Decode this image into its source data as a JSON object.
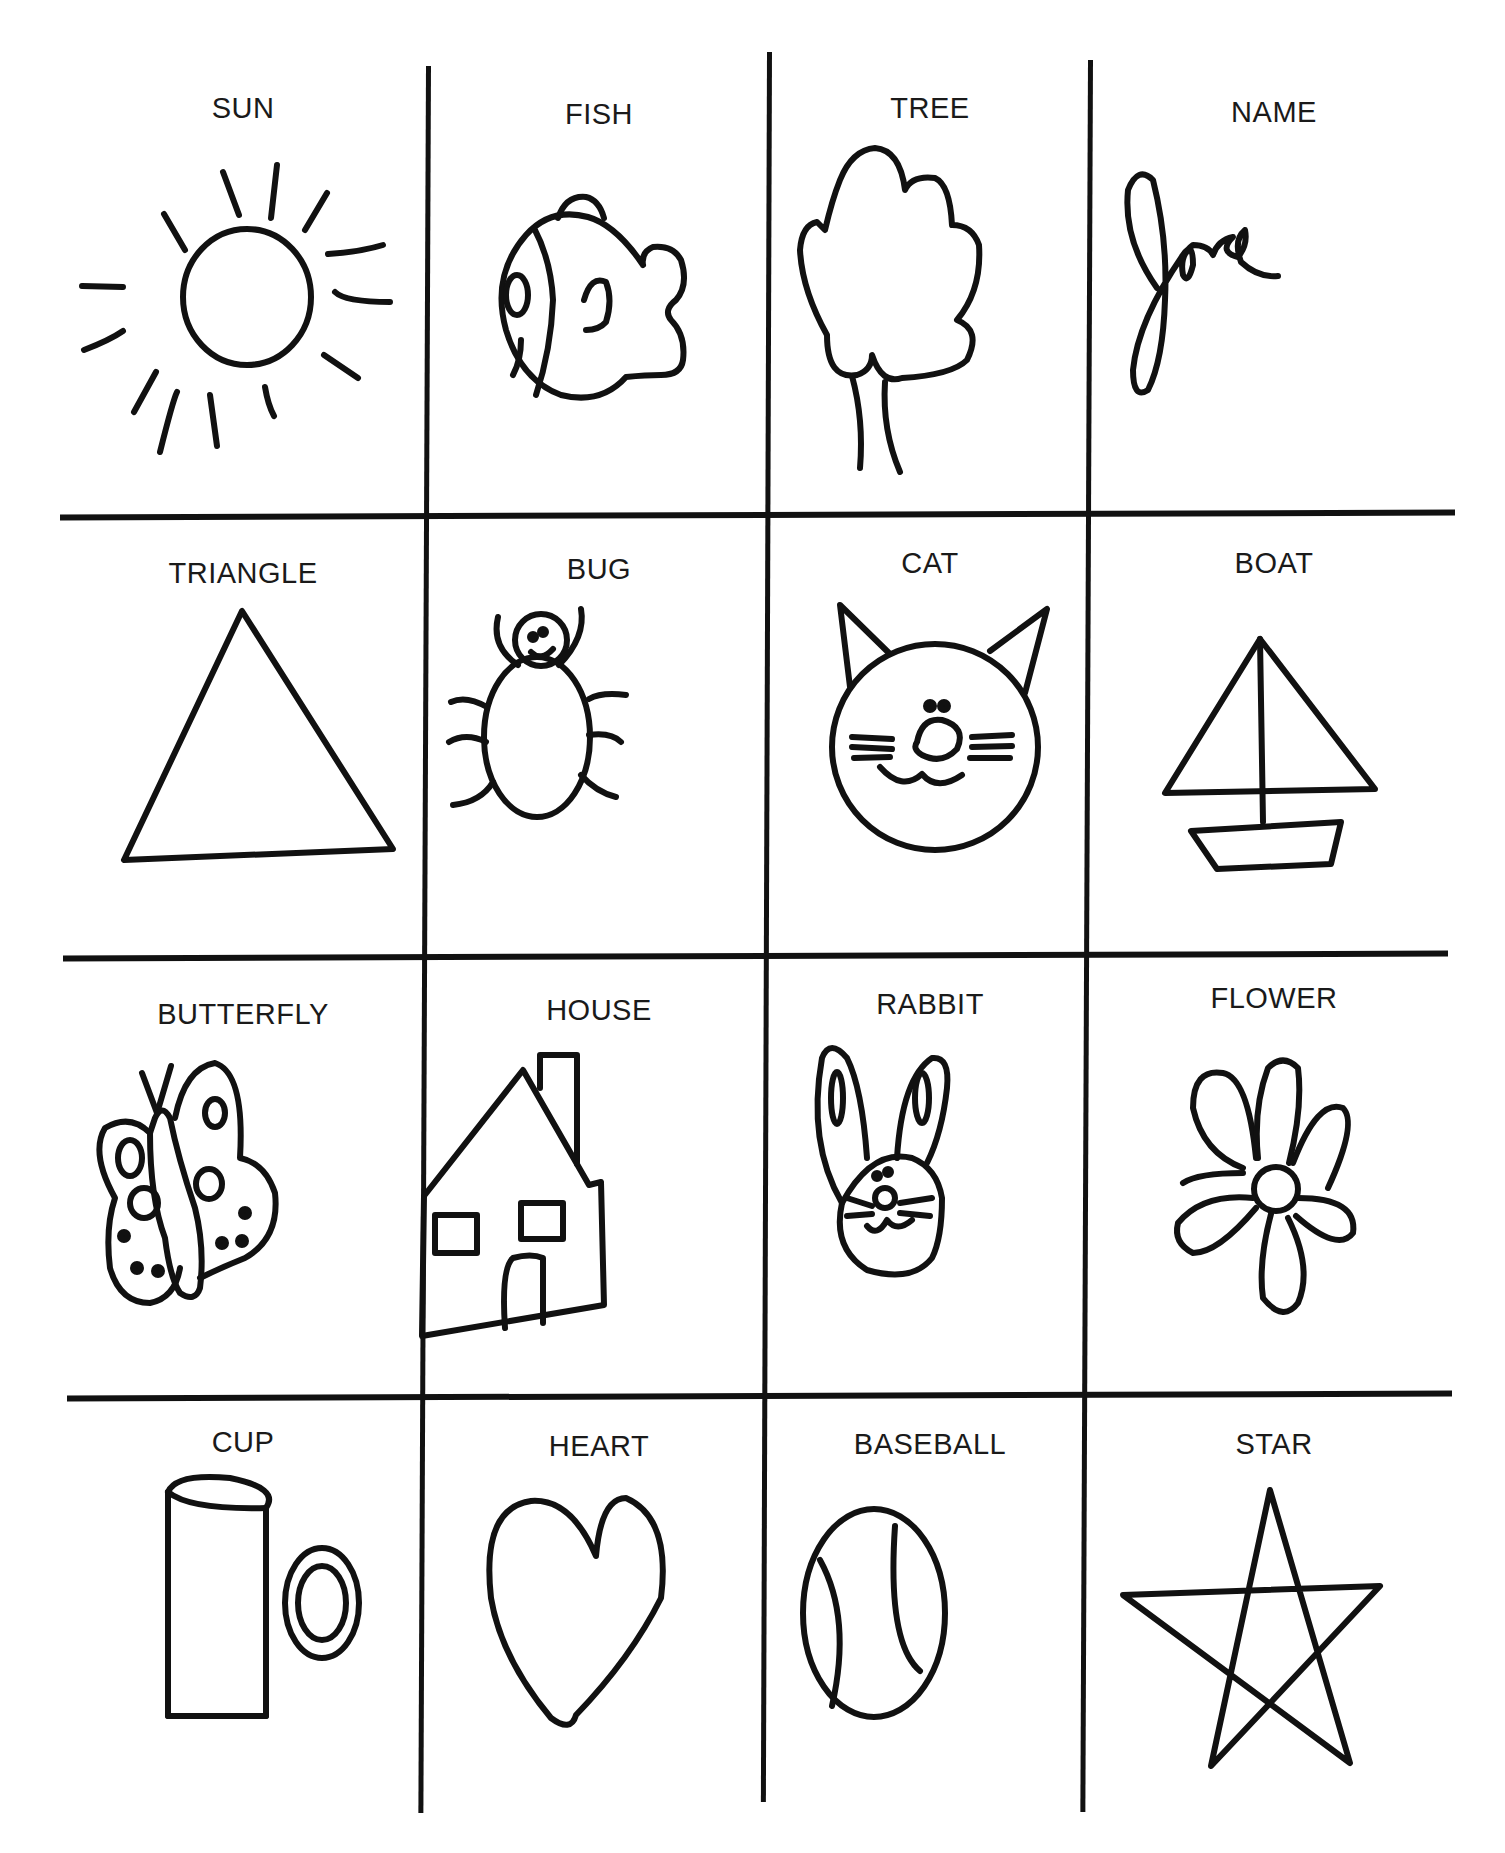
{
  "worksheet": {
    "cells": [
      {
        "label": "SUN",
        "icon": "sun-icon"
      },
      {
        "label": "FISH",
        "icon": "fish-icon"
      },
      {
        "label": "TREE",
        "icon": "tree-icon"
      },
      {
        "label": "NAME",
        "icon": "name-signature",
        "value": "Jose"
      },
      {
        "label": "TRIANGLE",
        "icon": "triangle-icon"
      },
      {
        "label": "BUG",
        "icon": "bug-icon"
      },
      {
        "label": "CAT",
        "icon": "cat-icon"
      },
      {
        "label": "BOAT",
        "icon": "boat-icon"
      },
      {
        "label": "BUTTERFLY",
        "icon": "butterfly-icon"
      },
      {
        "label": "HOUSE",
        "icon": "house-icon"
      },
      {
        "label": "RABBIT",
        "icon": "rabbit-icon"
      },
      {
        "label": "FLOWER",
        "icon": "flower-icon"
      },
      {
        "label": "CUP",
        "icon": "cup-icon"
      },
      {
        "label": "HEART",
        "icon": "heart-icon"
      },
      {
        "label": "BASEBALL",
        "icon": "baseball-icon"
      },
      {
        "label": "STAR",
        "icon": "star-icon"
      }
    ],
    "colors": {
      "ink": "#111111",
      "paper": "#ffffff"
    }
  }
}
